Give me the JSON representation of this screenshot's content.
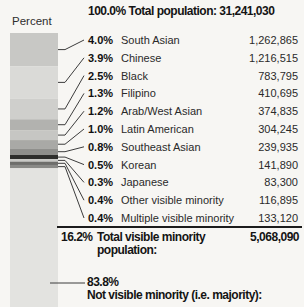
{
  "header": {
    "title": "100.0% Total population: 31,241,030"
  },
  "chart_data": {
    "type": "bar",
    "variant": "stacked-percentage-column",
    "title": "100.0% Total population: 31,241,030",
    "ylabel": "Percent",
    "total_population": "31,241,030",
    "ylim": [
      0,
      100
    ],
    "legend_position": "right",
    "groups": [
      {
        "label": "South Asian",
        "pct": 4.0,
        "pct_label": "4.0%",
        "population": "1,262,865",
        "color": "#c8c8c5"
      },
      {
        "label": "Chinese",
        "pct": 3.9,
        "pct_label": "3.9%",
        "population": "1,216,515",
        "color": "#dadad7"
      },
      {
        "label": "Black",
        "pct": 2.5,
        "pct_label": "2.5%",
        "population": "783,795",
        "color": "#cfcfcc"
      },
      {
        "label": "Filipino",
        "pct": 1.3,
        "pct_label": "1.3%",
        "population": "410,695",
        "color": "#b2b2af"
      },
      {
        "label": "Arab/West Asian",
        "pct": 1.2,
        "pct_label": "1.2%",
        "population": "374,835",
        "color": "#c6c6c3"
      },
      {
        "label": "Latin American",
        "pct": 1.0,
        "pct_label": "1.0%",
        "population": "304,245",
        "color": "#a9a9a6"
      },
      {
        "label": "Southeast Asian",
        "pct": 0.8,
        "pct_label": "0.8%",
        "population": "239,935",
        "color": "#8f8f8c"
      },
      {
        "label": "Korean",
        "pct": 0.5,
        "pct_label": "0.5%",
        "population": "141,890",
        "color": "#2e2e2c"
      },
      {
        "label": "Japanese",
        "pct": 0.3,
        "pct_label": "0.3%",
        "population": "83,300",
        "color": "#c9c9c6"
      },
      {
        "label": "Other visible minority",
        "pct": 0.4,
        "pct_label": "0.4%",
        "population": "116,895",
        "color": "#6e6e6b"
      },
      {
        "label": "Multiple visible minority",
        "pct": 0.4,
        "pct_label": "0.4%",
        "population": "133,120",
        "color": "#8a8a87"
      }
    ],
    "total": {
      "pct_label": "16.2%",
      "label": "Total visible minority population:",
      "value": "5,068,090"
    },
    "majority": {
      "pct_label": "83.8%",
      "label": "Not visible minority (i.e. majority):",
      "color": "#e3e3e0"
    },
    "leader_line_color": "#3c3c3c"
  }
}
